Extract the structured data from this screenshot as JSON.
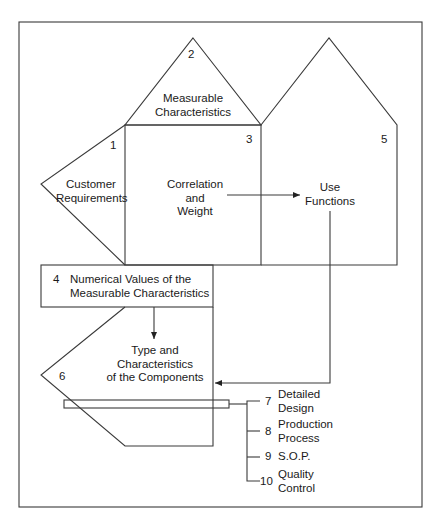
{
  "diagram": {
    "sections": [
      {
        "number": "1",
        "label_line1": "Customer",
        "label_line2": "Requirements"
      },
      {
        "number": "2",
        "label_line1": "Measurable",
        "label_line2": "Characteristics"
      },
      {
        "number": "3",
        "label_line1": "Correlation",
        "label_line2": "and",
        "label_line3": "Weight"
      },
      {
        "number": "4",
        "label_line1": "Numerical Values of the",
        "label_line2": "Measurable Characteristics"
      },
      {
        "number": "5",
        "label_line1": "Use",
        "label_line2": "Functions"
      },
      {
        "number": "6",
        "label_line1": "Type and",
        "label_line2": "Characteristics",
        "label_line3": "of the Components"
      }
    ],
    "outputs": [
      {
        "number": "7",
        "label_line1": "Detailed",
        "label_line2": "Design"
      },
      {
        "number": "8",
        "label_line1": "Production",
        "label_line2": "Process"
      },
      {
        "number": "9",
        "label_line1": "S.O.P."
      },
      {
        "number": "10",
        "label_line1": "Quality",
        "label_line2": "Control"
      }
    ]
  }
}
